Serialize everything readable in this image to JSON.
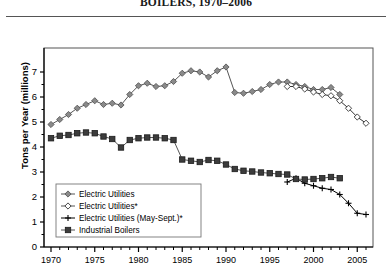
{
  "title": "BOILERS, 1970–2006",
  "axes": {
    "ylabel": "Tons per Year (millions)",
    "xlabel": "",
    "ylim": [
      0,
      7.6
    ],
    "xlim": [
      1969.2,
      2006.8
    ],
    "yticks": [
      0,
      1,
      2,
      3,
      4,
      5,
      6,
      7
    ],
    "ytick_labels": [
      "0",
      "1",
      "2",
      "3",
      "4",
      "5",
      "6",
      "7"
    ],
    "xticks": [
      1970,
      1975,
      1980,
      1985,
      1990,
      1995,
      2000,
      2005
    ],
    "xtick_labels": [
      "1970",
      "1975",
      "1980",
      "1985",
      "1990",
      "1995",
      "2000",
      "2005"
    ],
    "grid": false
  },
  "legend": {
    "position": "lower-left",
    "entries": [
      {
        "label": "Electric Utilities",
        "marker": "filled-diamond-icon",
        "color": "#8a8a8a"
      },
      {
        "label": "Electric Utilities*",
        "marker": "open-diamond-icon",
        "color": "#ffffff"
      },
      {
        "label": "Electric Utilities (May-Sept.)*",
        "marker": "plus-icon",
        "color": "#000000"
      },
      {
        "label": "Industrial Boilers",
        "marker": "filled-square-icon",
        "color": "#3c3c3c"
      }
    ]
  },
  "colors": {
    "electric_utilities": "#8a8a8a",
    "electric_utilities_star": "#ffffff",
    "electric_utilities_mayseptamber": "#000000",
    "industrial_boilers": "#3c3c3c",
    "axis": "#000000",
    "frame": "#555555"
  },
  "chart_data": {
    "type": "line",
    "title": "BOILERS, 1970–2006",
    "xlabel": "",
    "ylabel": "Tons per Year (millions)",
    "ylim": [
      0,
      7.6
    ],
    "xlim": [
      1969.2,
      2006.8
    ],
    "grid": false,
    "legend_position": "lower-left",
    "series": [
      {
        "name": "Electric Utilities",
        "marker": "filled-diamond",
        "color": "#8a8a8a",
        "x": [
          1970,
          1971,
          1972,
          1973,
          1974,
          1975,
          1976,
          1977,
          1978,
          1979,
          1980,
          1981,
          1982,
          1983,
          1984,
          1985,
          1986,
          1987,
          1988,
          1989,
          1990,
          1991,
          1992,
          1993,
          1994,
          1995,
          1996,
          1997,
          1998,
          1999,
          2000,
          2001,
          2002,
          2003
        ],
        "y": [
          4.9,
          5.1,
          5.3,
          5.55,
          5.7,
          5.85,
          5.7,
          5.75,
          5.68,
          6.1,
          6.45,
          6.55,
          6.42,
          6.45,
          6.62,
          6.95,
          7.05,
          7.0,
          6.8,
          7.05,
          7.2,
          6.18,
          6.15,
          6.22,
          6.3,
          6.5,
          6.6,
          6.6,
          6.5,
          6.42,
          6.3,
          6.3,
          6.38,
          6.1
        ]
      },
      {
        "name": "Electric Utilities*",
        "marker": "open-diamond",
        "color": "#ffffff",
        "x": [
          1997,
          1998,
          1999,
          2000,
          2001,
          2002,
          2003,
          2004,
          2005,
          2006
        ],
        "y": [
          6.42,
          6.42,
          6.32,
          6.2,
          6.1,
          6.05,
          5.85,
          5.55,
          5.2,
          4.95
        ]
      },
      {
        "name": "Electric Utilities (May-Sept.)*",
        "marker": "plus",
        "color": "#000000",
        "x": [
          1997,
          1998,
          1999,
          2000,
          2001,
          2002,
          2003,
          2004,
          2005,
          2006
        ],
        "y": [
          2.6,
          2.75,
          2.55,
          2.45,
          2.35,
          2.3,
          2.1,
          1.75,
          1.35,
          1.3
        ]
      },
      {
        "name": "Industrial Boilers",
        "marker": "filled-square",
        "color": "#3c3c3c",
        "x": [
          1970,
          1971,
          1972,
          1973,
          1974,
          1975,
          1976,
          1977,
          1978,
          1979,
          1980,
          1981,
          1982,
          1983,
          1984,
          1985,
          1986,
          1987,
          1988,
          1989,
          1990,
          1991,
          1992,
          1993,
          1994,
          1995,
          1996,
          1997,
          1998,
          1999,
          2000,
          2001,
          2002,
          2003
        ],
        "y": [
          4.35,
          4.45,
          4.48,
          4.55,
          4.58,
          4.55,
          4.42,
          4.32,
          3.98,
          4.28,
          4.35,
          4.38,
          4.38,
          4.35,
          4.28,
          3.5,
          3.45,
          3.4,
          3.48,
          3.45,
          3.3,
          3.12,
          3.05,
          3.02,
          2.98,
          2.95,
          2.92,
          2.9,
          2.72,
          2.7,
          2.72,
          2.75,
          2.8,
          2.75
        ]
      }
    ]
  }
}
